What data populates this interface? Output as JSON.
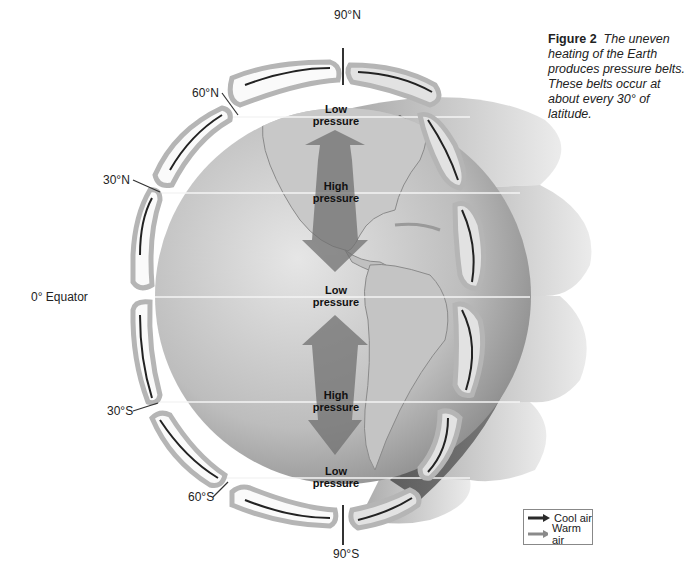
{
  "caption": {
    "figure_label": "Figure 2",
    "text": "The uneven heating of the Earth produces pressure belts. These belts occur at about every 30° of latitude."
  },
  "latitudes": {
    "n90": "90°N",
    "n60": "60°N",
    "n30": "30°N",
    "equator": "0° Equator",
    "s30": "30°S",
    "s60": "60°S",
    "s90": "90°S"
  },
  "pressure_belts": {
    "n60": {
      "line1": "Low",
      "line2": "pressure"
    },
    "n30": {
      "line1": "High",
      "line2": "pressure"
    },
    "equator": {
      "line1": "Low",
      "line2": "pressure"
    },
    "s30": {
      "line1": "High",
      "line2": "pressure"
    },
    "s60": {
      "line1": "Low",
      "line2": "pressure"
    }
  },
  "legend": {
    "items": [
      {
        "label": "Cool air",
        "color": "#2a2a2a"
      },
      {
        "label": "Warm air",
        "color": "#8a8a8a"
      }
    ]
  },
  "colors": {
    "globe_light": "#d9d9d9",
    "globe_dark": "#8c8c8c",
    "cell_fill": "#fafafa",
    "cell_border": "#b8b8b8",
    "arrow_band": "#7a7a7a",
    "shadow": "#5a5a5a"
  }
}
